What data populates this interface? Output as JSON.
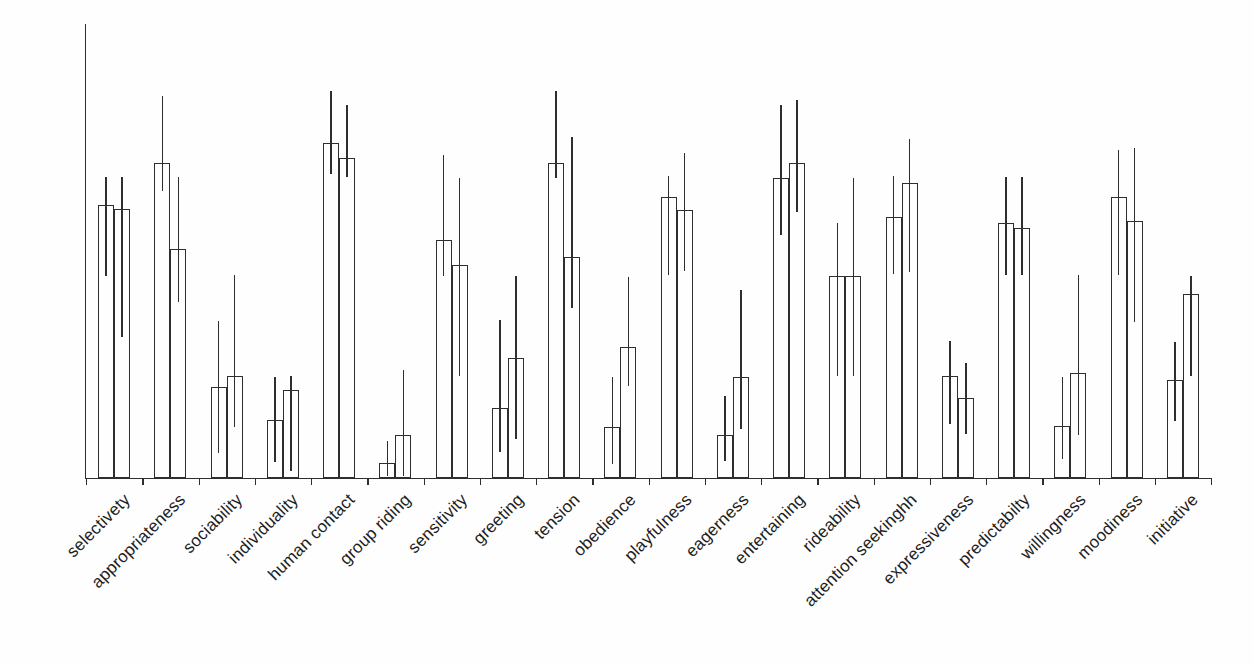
{
  "chart_data": {
    "type": "bar",
    "title": "",
    "xlabel": "",
    "ylabel": "",
    "ylim": [
      0,
      100
    ],
    "y_units": "percent of axis height (no y-axis scale shown in figure)",
    "grid": false,
    "legend": "none",
    "bar_fill": "#fefefe",
    "line_color": "#2e2e2e",
    "error_bars": "asymmetric vertical whiskers drawn through each bar top",
    "categories": [
      "selectivety",
      "appropriateness",
      "sociability",
      "individuality",
      "human contact",
      "group riding",
      "sensitivity",
      "greeting",
      "tension",
      "obedience",
      "playfulness",
      "eagerness",
      "entertaining",
      "rideability",
      "attention seekinghh",
      "expressiveness",
      "predictabilty",
      "willingness",
      "moodiness",
      "initiative"
    ],
    "series": [
      {
        "name": "bar-1",
        "values": [
          60.2,
          69.4,
          20.0,
          12.8,
          73.8,
          3.3,
          52.4,
          15.4,
          69.4,
          11.2,
          61.9,
          9.5,
          66.1,
          44.5,
          57.5,
          22.5,
          56.2,
          11.5,
          61.9,
          21.6
        ],
        "whisker_low": [
          44.5,
          63.2,
          5.5,
          3.5,
          67.0,
          0.4,
          44.5,
          5.7,
          66.1,
          3.1,
          44.7,
          3.7,
          53.5,
          22.5,
          44.9,
          11.9,
          44.7,
          4.2,
          44.7,
          12.6
        ],
        "whisker_high": [
          66.3,
          84.1,
          34.6,
          22.2,
          85.2,
          8.1,
          71.1,
          34.8,
          85.2,
          22.2,
          66.5,
          18.1,
          82.2,
          56.2,
          66.5,
          30.2,
          66.3,
          22.2,
          72.2,
          30.0
        ]
      },
      {
        "name": "bar-2",
        "values": [
          59.3,
          50.4,
          22.5,
          19.4,
          70.5,
          9.5,
          46.9,
          26.4,
          48.7,
          28.9,
          59.0,
          22.2,
          69.4,
          44.5,
          65.0,
          17.6,
          55.1,
          23.1,
          56.6,
          40.5
        ],
        "whisker_low": [
          31.1,
          38.8,
          11.2,
          1.5,
          66.3,
          0.4,
          22.5,
          8.6,
          37.4,
          20.3,
          45.6,
          10.8,
          58.6,
          22.5,
          45.4,
          9.7,
          44.7,
          9.5,
          34.4,
          22.5
        ],
        "whisker_high": [
          66.3,
          66.3,
          44.7,
          22.5,
          82.2,
          23.8,
          66.1,
          44.5,
          75.1,
          44.3,
          71.6,
          41.4,
          83.3,
          66.1,
          74.7,
          25.3,
          66.3,
          44.7,
          72.7,
          44.5
        ]
      }
    ]
  }
}
